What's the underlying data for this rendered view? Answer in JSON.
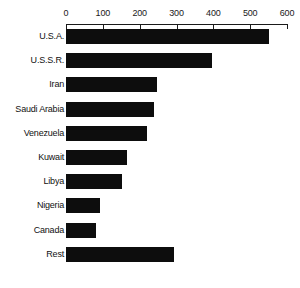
{
  "chart_data": {
    "type": "bar",
    "orientation": "horizontal",
    "title": "",
    "subtitle": "",
    "xlabel": "",
    "ylabel": "",
    "xlim": [
      0,
      600
    ],
    "ylim": null,
    "grid": false,
    "legend": null,
    "legend_position": "none",
    "x_ticks": [
      0,
      100,
      200,
      300,
      400,
      500,
      600
    ],
    "x_tick_labels": [
      "0",
      "100",
      "200",
      "300",
      "400",
      "500",
      "600"
    ],
    "axis_position": "top",
    "bar_color": "#0d0d0d",
    "categories": [
      "U.S.A.",
      "U.S.S.R.",
      "Iran",
      "Saudi Arabia",
      "Venezuela",
      "Kuwait",
      "Libya",
      "Nigeria",
      "Canada",
      "Rest"
    ],
    "values": [
      551,
      396,
      247,
      239,
      220,
      166,
      152,
      92,
      81,
      293
    ],
    "bars": [
      {
        "label": "U.S.A.",
        "value": 551
      },
      {
        "label": "U.S.S.R.",
        "value": 396
      },
      {
        "label": "Iran",
        "value": 247
      },
      {
        "label": "Saudi Arabia",
        "value": 239
      },
      {
        "label": "Venezuela",
        "value": 220
      },
      {
        "label": "Kuwait",
        "value": 166
      },
      {
        "label": "Libya",
        "value": 152
      },
      {
        "label": "Nigeria",
        "value": 92
      },
      {
        "label": "Canada",
        "value": 81
      },
      {
        "label": "Rest",
        "value": 293
      }
    ]
  }
}
